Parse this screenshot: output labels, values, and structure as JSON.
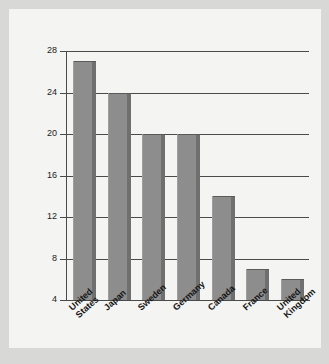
{
  "chart_data": {
    "type": "bar",
    "title": "",
    "xlabel": "",
    "ylabel": "Recycled municipal waste (%)",
    "ylim": [
      4,
      28
    ],
    "yticks": [
      4,
      8,
      12,
      16,
      20,
      24,
      28
    ],
    "grid": "horizontal",
    "legend": "none",
    "categories": [
      "United States",
      "Japan",
      "Sweden",
      "Germany",
      "Canada",
      "France",
      "United Kingdom"
    ],
    "category_lines": [
      [
        "United",
        "States"
      ],
      [
        "Japan",
        ""
      ],
      [
        "Sweden",
        ""
      ],
      [
        "Germany",
        ""
      ],
      [
        "Canada",
        ""
      ],
      [
        "France",
        ""
      ],
      [
        "United",
        "Kingdom"
      ]
    ],
    "values": [
      27,
      24,
      20,
      20,
      14,
      7,
      6
    ],
    "bar_color": "#8d8d8d",
    "bar_shadow_color": "#6f6f6f",
    "axis_color": "#4a4a4a",
    "background_color": "#f4f4f2"
  }
}
